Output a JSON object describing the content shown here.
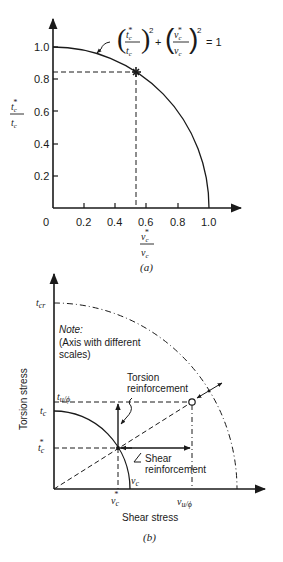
{
  "figure_a": {
    "caption": "(a)",
    "equation": {
      "num1": "t",
      "num1_sub": "c",
      "num1_sup": "*",
      "den1": "t",
      "den1_sub": "c",
      "num2": "v",
      "num2_sub": "c",
      "num2_sup": "*",
      "den2": "v",
      "den2_sub": "c",
      "exponent": "2",
      "plus": "+",
      "equals": "= 1"
    },
    "y_label": {
      "num": "t",
      "num_sub": "c",
      "num_sup": "*",
      "den": "t",
      "den_sub": "c"
    },
    "x_label": {
      "num": "v",
      "num_sub": "c",
      "num_sup": "*",
      "den": "v",
      "den_sub": "c"
    },
    "y_ticks": [
      "1.0",
      "0.8",
      "0.6",
      "0.4",
      "0.2"
    ],
    "x_ticks": [
      "0",
      "0.2",
      "0.4",
      "0.6",
      "0.8",
      "1.0"
    ],
    "marked_point": {
      "x": 0.53,
      "y": 0.84
    }
  },
  "figure_b": {
    "caption": "(b)",
    "x_axis_title": "Shear stress",
    "y_axis_title": "Torsion stress",
    "note_title": "Note:",
    "note_line1": "(Axis with different",
    "note_line2": "scales)",
    "labels": {
      "t_cr": {
        "base": "t",
        "sub": "cr"
      },
      "t_u_phi": {
        "base": "t",
        "sub": "u/ϕ"
      },
      "t_c": {
        "base": "t",
        "sub": "c"
      },
      "t_c_star": {
        "base": "t",
        "sub": "c",
        "sup": "*"
      },
      "v_c_star": {
        "base": "v",
        "sub": "c",
        "sup": "*"
      },
      "v_c": {
        "base": "v",
        "sub": "c"
      },
      "v_u_phi": {
        "base": "v",
        "sub": "u/ϕ"
      }
    },
    "annotation_torsion_1": "Torsion",
    "annotation_torsion_2": "reinforcement",
    "annotation_shear_1": "Shear",
    "annotation_shear_2": "reinforcement"
  }
}
